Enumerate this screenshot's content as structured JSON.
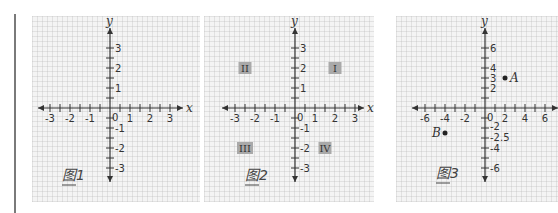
{
  "figures": [
    {
      "caption": "图1",
      "x_axis_label": "x",
      "y_axis_label": "y",
      "origin_label": "0",
      "x_ticks": [
        -3,
        -2,
        -1,
        1,
        2,
        3
      ],
      "x_tick_labels": [
        "-3",
        "-2",
        "-1",
        "1",
        "2",
        "3"
      ],
      "y_ticks": [
        3,
        2,
        1,
        -1,
        -2,
        -3
      ],
      "y_tick_labels": [
        "3",
        "2",
        "1",
        "-1",
        "-2",
        "-3"
      ],
      "range": [
        -3.5,
        3.5
      ],
      "minor_step": 0.5
    },
    {
      "caption": "图2",
      "x_axis_label": "x",
      "y_axis_label": "y",
      "origin_label": "0",
      "x_ticks": [
        -3,
        -2,
        -1,
        1,
        2,
        3
      ],
      "x_tick_labels": [
        "-3",
        "-2",
        "-1",
        "1",
        "2",
        "3"
      ],
      "y_ticks": [
        3,
        2,
        1,
        -1,
        -2,
        -3
      ],
      "y_tick_labels": [
        "3",
        "2",
        "1",
        "-1",
        "-2",
        "-3"
      ],
      "range": [
        -3.5,
        3.5
      ],
      "minor_step": 0.5,
      "quadrants": [
        {
          "label": "I",
          "x": 2,
          "y": 2
        },
        {
          "label": "II",
          "x": -2.5,
          "y": 2
        },
        {
          "label": "III",
          "x": -2.5,
          "y": -2
        },
        {
          "label": "IV",
          "x": 1.5,
          "y": -2
        }
      ],
      "quadrant_box_color": "#a9a9a9"
    },
    {
      "caption": "图3",
      "x_axis_label": "x",
      "y_axis_label": "y",
      "origin_label": "0",
      "x_ticks": [
        -6,
        -4,
        -2,
        2,
        4,
        6
      ],
      "x_tick_labels": [
        "-6",
        "-4",
        "-2",
        "2",
        "4",
        "6"
      ],
      "y_ticks": [
        6,
        4,
        3,
        2,
        -2,
        -2.5,
        -4,
        -6
      ],
      "y_tick_labels": [
        "6",
        "4",
        "3",
        "2",
        "-2",
        "-2.5",
        "-4",
        "-6"
      ],
      "range": [
        -7,
        7
      ],
      "minor_step": 1,
      "points": [
        {
          "label": "A",
          "x": 2,
          "y": 3
        },
        {
          "label": "B",
          "x": -4,
          "y": -2.5
        }
      ]
    }
  ],
  "colors": {
    "axis": "#333333",
    "grid_bg": "#f4f4f4",
    "side_bar": "#7a7a7a"
  }
}
